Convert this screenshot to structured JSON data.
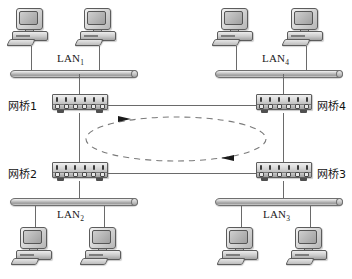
{
  "diagram": {
    "lans": [
      {
        "id": "lan1",
        "label": "LAN",
        "subscript": "1"
      },
      {
        "id": "lan4",
        "label": "LAN",
        "subscript": "4"
      },
      {
        "id": "lan2",
        "label": "LAN",
        "subscript": "2"
      },
      {
        "id": "lan3",
        "label": "LAN",
        "subscript": "3"
      }
    ],
    "bridges": [
      {
        "id": "bridge1",
        "label": "网桥1"
      },
      {
        "id": "bridge4",
        "label": "网桥4"
      },
      {
        "id": "bridge2",
        "label": "网桥2"
      },
      {
        "id": "bridge3",
        "label": "网桥3"
      }
    ],
    "hosts": [
      {
        "id": "lan1-host-a",
        "lan": "LAN1"
      },
      {
        "id": "lan1-host-b",
        "lan": "LAN1"
      },
      {
        "id": "lan4-host-a",
        "lan": "LAN4"
      },
      {
        "id": "lan4-host-b",
        "lan": "LAN4"
      },
      {
        "id": "lan2-host-a",
        "lan": "LAN2"
      },
      {
        "id": "lan2-host-b",
        "lan": "LAN2"
      },
      {
        "id": "lan3-host-a",
        "lan": "LAN3"
      },
      {
        "id": "lan3-host-b",
        "lan": "LAN3"
      }
    ],
    "loop": {
      "style": "dashed-ellipse",
      "arrows": [
        {
          "id": "loop-arrow-top",
          "direction": "right"
        },
        {
          "id": "loop-arrow-bottom",
          "direction": "left"
        }
      ]
    },
    "colors": {
      "line": "#6a6a6a",
      "device_fill": "#c8c8c8",
      "device_stroke": "#5c5c5c",
      "text": "#111111",
      "loop": "#7a7a7a"
    }
  }
}
